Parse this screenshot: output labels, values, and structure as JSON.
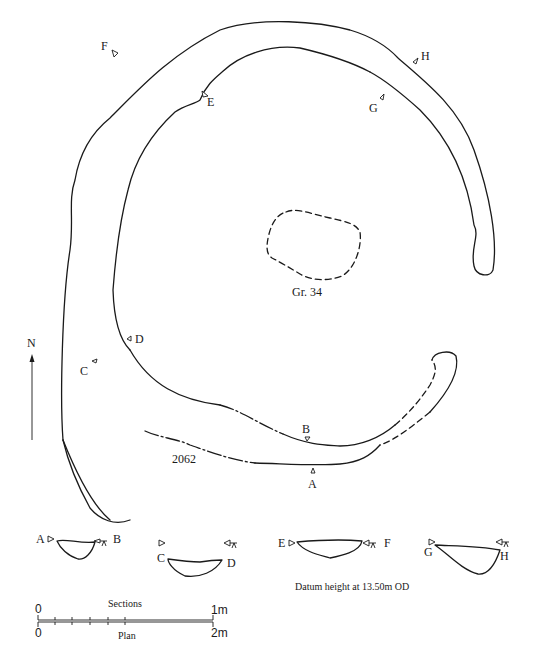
{
  "plan": {
    "feature_label": "2062",
    "grave_label": "Gr. 34",
    "north_label": "N",
    "section_markers": [
      "A",
      "B",
      "C",
      "D",
      "E",
      "F",
      "G",
      "H"
    ]
  },
  "sections": {
    "profiles": [
      {
        "left": "A",
        "right": "B"
      },
      {
        "left": "C",
        "right": "D"
      },
      {
        "left": "E",
        "right": "F"
      },
      {
        "left": "G",
        "right": "H"
      }
    ],
    "datum_note": "Datum height at 13.50m OD"
  },
  "scale_bars": {
    "sections": {
      "label": "Sections",
      "start": "0",
      "end": "1m"
    },
    "plan": {
      "label": "Plan",
      "start": "0",
      "end": "2m"
    }
  },
  "colors": {
    "ink": "#1a1a1a",
    "background": "#ffffff"
  }
}
